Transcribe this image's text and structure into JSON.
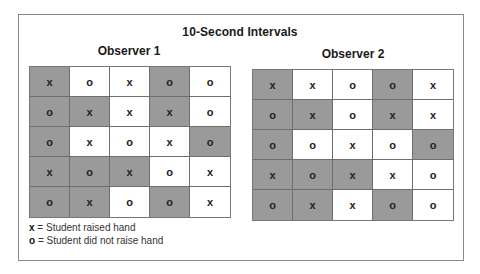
{
  "title": "10-Second Intervals",
  "observers": [
    {
      "label": "Observer 1",
      "rows": [
        [
          {
            "v": "x",
            "shaded": true
          },
          {
            "v": "o",
            "shaded": false
          },
          {
            "v": "x",
            "shaded": false
          },
          {
            "v": "o",
            "shaded": true
          },
          {
            "v": "o",
            "shaded": false
          }
        ],
        [
          {
            "v": "o",
            "shaded": true
          },
          {
            "v": "x",
            "shaded": true
          },
          {
            "v": "x",
            "shaded": false
          },
          {
            "v": "x",
            "shaded": true
          },
          {
            "v": "o",
            "shaded": false
          }
        ],
        [
          {
            "v": "o",
            "shaded": true
          },
          {
            "v": "x",
            "shaded": false
          },
          {
            "v": "o",
            "shaded": false
          },
          {
            "v": "x",
            "shaded": false
          },
          {
            "v": "o",
            "shaded": true
          }
        ],
        [
          {
            "v": "x",
            "shaded": true
          },
          {
            "v": "o",
            "shaded": true
          },
          {
            "v": "x",
            "shaded": true
          },
          {
            "v": "o",
            "shaded": false
          },
          {
            "v": "x",
            "shaded": false
          }
        ],
        [
          {
            "v": "o",
            "shaded": true
          },
          {
            "v": "x",
            "shaded": true
          },
          {
            "v": "o",
            "shaded": false
          },
          {
            "v": "o",
            "shaded": true
          },
          {
            "v": "x",
            "shaded": false
          }
        ]
      ]
    },
    {
      "label": "Observer 2",
      "rows": [
        [
          {
            "v": "x",
            "shaded": true
          },
          {
            "v": "x",
            "shaded": false
          },
          {
            "v": "o",
            "shaded": false
          },
          {
            "v": "o",
            "shaded": true
          },
          {
            "v": "x",
            "shaded": false
          }
        ],
        [
          {
            "v": "o",
            "shaded": true
          },
          {
            "v": "x",
            "shaded": true
          },
          {
            "v": "o",
            "shaded": false
          },
          {
            "v": "x",
            "shaded": true
          },
          {
            "v": "x",
            "shaded": false
          }
        ],
        [
          {
            "v": "o",
            "shaded": true
          },
          {
            "v": "o",
            "shaded": false
          },
          {
            "v": "x",
            "shaded": false
          },
          {
            "v": "o",
            "shaded": false
          },
          {
            "v": "o",
            "shaded": true
          }
        ],
        [
          {
            "v": "x",
            "shaded": true
          },
          {
            "v": "o",
            "shaded": true
          },
          {
            "v": "x",
            "shaded": true
          },
          {
            "v": "x",
            "shaded": false
          },
          {
            "v": "o",
            "shaded": false
          }
        ],
        [
          {
            "v": "o",
            "shaded": true
          },
          {
            "v": "x",
            "shaded": true
          },
          {
            "v": "x",
            "shaded": false
          },
          {
            "v": "o",
            "shaded": true
          },
          {
            "v": "o",
            "shaded": false
          }
        ]
      ]
    }
  ],
  "legend": [
    {
      "symbol": "x",
      "text": "= Student raised hand"
    },
    {
      "symbol": "o",
      "text": "= Student did not raise hand"
    }
  ],
  "colors": {
    "shaded": "#9a9a9a",
    "unshaded": "#ffffff",
    "border": "#6e6e6e"
  }
}
